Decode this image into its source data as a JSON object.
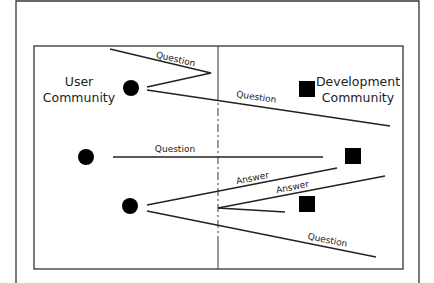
{
  "diagram": {
    "title": "",
    "colors": {
      "stroke": "#222222",
      "background": "#ffffff",
      "fill": "#000000"
    },
    "user_community": {
      "line1": "User",
      "line2": "Community"
    },
    "development_community": {
      "line1": "Development",
      "line2": "Community"
    },
    "boundary": "dash-dot vertical divider between communities",
    "nodes": [
      {
        "id": "user-1",
        "shape": "circle",
        "side": "user"
      },
      {
        "id": "user-2",
        "shape": "circle",
        "side": "user"
      },
      {
        "id": "user-3",
        "shape": "circle",
        "side": "user"
      },
      {
        "id": "dev-1",
        "shape": "square",
        "side": "development"
      },
      {
        "id": "dev-2",
        "shape": "square",
        "side": "development"
      },
      {
        "id": "dev-3",
        "shape": "square",
        "side": "development"
      }
    ],
    "flows": [
      {
        "id": "q1",
        "label": "Question",
        "from": "user-1",
        "note": "bounces back before crossing boundary"
      },
      {
        "id": "q2",
        "label": "Question",
        "from": "user-1",
        "note": "crosses boundary, misses target"
      },
      {
        "id": "q3",
        "label": "Question",
        "from": "user-2",
        "note": "straight, stops short of dev-2"
      },
      {
        "id": "a1",
        "label": "Answer",
        "to": "user-3"
      },
      {
        "id": "a2",
        "label": "Answer",
        "note": "stops at boundary"
      },
      {
        "id": "q4",
        "label": "Question",
        "from": "user-3"
      }
    ]
  }
}
